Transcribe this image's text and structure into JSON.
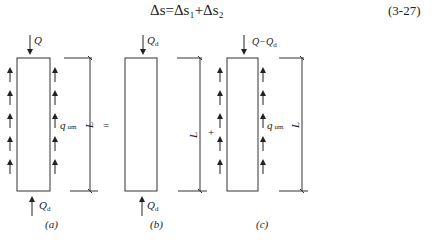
{
  "formula": {
    "text": "Δs=Δs₁+Δs₂",
    "number": "(3-27)"
  },
  "figure": {
    "panels": [
      {
        "id": "a",
        "caption": "(a)",
        "top_load": "Q",
        "bottom_load": "Q_d",
        "side_load": "q_um",
        "length": "L",
        "operator_after": "="
      },
      {
        "id": "b",
        "caption": "(b)",
        "top_load": "Q_d",
        "bottom_load": "Q_d",
        "side_load": "",
        "length": "L",
        "operator_after": "+"
      },
      {
        "id": "c",
        "caption": "(c)",
        "top_load": "Q−Q_d",
        "bottom_load": "",
        "side_load": "q_um",
        "length": "L",
        "operator_after": ""
      }
    ]
  },
  "labels": {
    "a_top": "Q",
    "a_bottom_main": "Q",
    "a_bottom_sub": "d",
    "a_side_main": "q",
    "a_side_sub": "um",
    "a_len": "L",
    "a_cap": "(a)",
    "op1": "=",
    "b_top_main": "Q",
    "b_top_sub": "d",
    "b_bottom_main": "Q",
    "b_bottom_sub": "d",
    "b_len": "L",
    "b_cap": "(b)",
    "op2": "+",
    "c_top": "Q−Q",
    "c_top_sub": "d",
    "c_side_main": "q",
    "c_side_sub": "um",
    "c_len": "L",
    "c_cap": "(c)"
  }
}
